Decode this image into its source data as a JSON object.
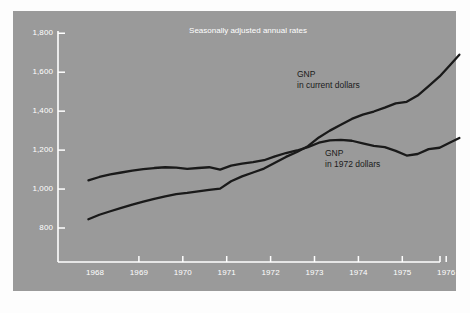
{
  "figure": {
    "panel_color": "#9a9a9a",
    "page_color": "#fdfdfd",
    "axis_color": "#ffffff",
    "line_color": "#1a1a1a"
  },
  "chart_data": {
    "type": "line",
    "title": "Seasonally adjusted annual rates",
    "xlabel": "",
    "ylabel": "",
    "xlim": [
      1967.75,
      1976.5
    ],
    "ylim": [
      760,
      1860
    ],
    "grid": false,
    "legend": "inline-annotations",
    "xticks": [
      "1968",
      "1969",
      "1970",
      "1971",
      "1972",
      "1973",
      "1974",
      "1975",
      "1976"
    ],
    "xtick_values": [
      1968,
      1969,
      1970,
      1971,
      1972,
      1973,
      1974,
      1975,
      1976
    ],
    "yticks": [
      "800",
      "1,000",
      "1,200",
      "1,400",
      "1,600",
      "1,800"
    ],
    "ytick_values": [
      800,
      1000,
      1200,
      1400,
      1600,
      1800
    ],
    "series": [
      {
        "name": "GNP in current dollars",
        "label_line1": "GNP",
        "label_line2": "in current dollars",
        "x": [
          1967.85,
          1968.1,
          1968.35,
          1968.6,
          1968.85,
          1969.1,
          1969.35,
          1969.6,
          1969.85,
          1970.1,
          1970.35,
          1970.6,
          1970.85,
          1971.1,
          1971.35,
          1971.6,
          1971.85,
          1972.1,
          1972.35,
          1972.6,
          1972.85,
          1973.1,
          1973.35,
          1973.6,
          1973.85,
          1974.1,
          1974.35,
          1974.6,
          1974.85,
          1975.1,
          1975.35,
          1975.6,
          1975.85,
          1976.1,
          1976.3
        ],
        "values": [
          845,
          868,
          886,
          903,
          920,
          935,
          950,
          963,
          974,
          980,
          988,
          996,
          1002,
          1040,
          1065,
          1085,
          1105,
          1135,
          1165,
          1190,
          1220,
          1265,
          1300,
          1330,
          1360,
          1382,
          1398,
          1418,
          1440,
          1448,
          1480,
          1528,
          1578,
          1640,
          1690
        ]
      },
      {
        "name": "GNP in 1972 dollars",
        "label_line1": "GNP",
        "label_line2": "in 1972 dollars",
        "x": [
          1967.85,
          1968.1,
          1968.35,
          1968.6,
          1968.85,
          1969.1,
          1969.35,
          1969.6,
          1969.85,
          1970.1,
          1970.35,
          1970.6,
          1970.85,
          1971.1,
          1971.35,
          1971.6,
          1971.85,
          1972.1,
          1972.35,
          1972.6,
          1972.85,
          1973.1,
          1973.35,
          1973.6,
          1973.85,
          1974.1,
          1974.35,
          1974.6,
          1974.85,
          1975.1,
          1975.35,
          1975.6,
          1975.85,
          1976.1,
          1976.3
        ],
        "values": [
          1045,
          1062,
          1075,
          1085,
          1095,
          1102,
          1108,
          1112,
          1110,
          1104,
          1108,
          1112,
          1100,
          1120,
          1130,
          1138,
          1148,
          1168,
          1185,
          1198,
          1215,
          1238,
          1250,
          1252,
          1248,
          1235,
          1222,
          1215,
          1196,
          1172,
          1180,
          1205,
          1212,
          1240,
          1262
        ]
      }
    ]
  }
}
